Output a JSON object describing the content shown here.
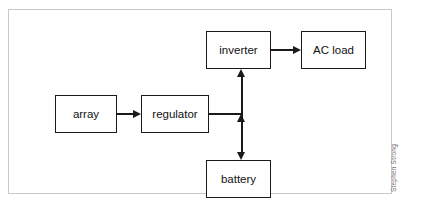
{
  "figure": {
    "type": "block-diagram",
    "credit": "Stephen Strong"
  },
  "blocks": [
    {
      "id": "array",
      "label": "array"
    },
    {
      "id": "regulator",
      "label": "regulator"
    },
    {
      "id": "inverter",
      "label": "inverter"
    },
    {
      "id": "acload",
      "label": "AC load"
    },
    {
      "id": "battery",
      "label": "battery"
    }
  ],
  "connections": [
    {
      "id": "array-to-regulator",
      "from": "array",
      "to": "regulator",
      "direction": "one-way",
      "orientation": "horizontal"
    },
    {
      "id": "regulator-to-bus",
      "from": "regulator",
      "to": "bus",
      "direction": "none",
      "orientation": "horizontal"
    },
    {
      "id": "bus-to-inverter",
      "from": "bus",
      "to": "inverter",
      "direction": "one-way",
      "orientation": "vertical"
    },
    {
      "id": "bus-to-battery",
      "from": "bus",
      "to": "battery",
      "direction": "bidirectional",
      "orientation": "vertical"
    },
    {
      "id": "inverter-to-acload",
      "from": "inverter",
      "to": "acload",
      "direction": "one-way",
      "orientation": "horizontal"
    }
  ],
  "colors": {
    "line": "#1a1a1a",
    "frame": "#c9c9c9",
    "background": "#ffffff",
    "credit": "#6f6f6f"
  }
}
